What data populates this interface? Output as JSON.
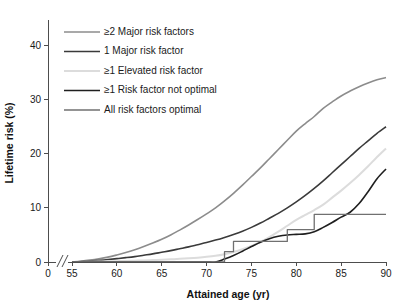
{
  "chart_data": {
    "type": "line",
    "title": "",
    "xlabel": "Attained age (yr)",
    "ylabel": "Lifetime risk (%)",
    "xlim": [
      55,
      90
    ],
    "ylim": [
      0,
      44
    ],
    "grid": false,
    "axis_break": true,
    "axis_break_label": "0",
    "legend_position": "top-left",
    "xticks": [
      "0",
      "55",
      "60",
      "65",
      "70",
      "75",
      "80",
      "85",
      "90"
    ],
    "xtick_values": [
      0,
      55,
      60,
      65,
      70,
      75,
      80,
      85,
      90
    ],
    "yticks": [
      "0",
      "10",
      "20",
      "30",
      "40"
    ],
    "ytick_values": [
      0,
      10,
      20,
      30,
      40
    ],
    "x": [
      55,
      56,
      57,
      58,
      59,
      60,
      61,
      62,
      63,
      64,
      65,
      66,
      67,
      68,
      69,
      70,
      71,
      72,
      73,
      74,
      75,
      76,
      77,
      78,
      79,
      80,
      81,
      82,
      83,
      84,
      85,
      86,
      87,
      88,
      89,
      90
    ],
    "series": [
      {
        "name": "≥2 Major risk factors",
        "color": "#8c8c8c",
        "width": 1.6,
        "values": [
          0.0,
          0.15,
          0.35,
          0.6,
          0.9,
          1.3,
          1.75,
          2.25,
          2.85,
          3.5,
          4.2,
          5.0,
          5.9,
          6.85,
          7.85,
          8.9,
          10.0,
          11.3,
          12.7,
          14.2,
          15.8,
          17.4,
          19.1,
          20.8,
          22.5,
          24.2,
          25.6,
          26.9,
          28.4,
          29.6,
          30.7,
          31.6,
          32.4,
          33.1,
          33.7,
          34.1
        ]
      },
      {
        "name": "1 Major risk factor",
        "color": "#3a3a3a",
        "width": 1.6,
        "values": [
          0.0,
          0.08,
          0.18,
          0.3,
          0.45,
          0.62,
          0.8,
          1.0,
          1.25,
          1.5,
          1.8,
          2.1,
          2.45,
          2.8,
          3.2,
          3.6,
          4.05,
          4.55,
          5.1,
          5.7,
          6.4,
          7.2,
          8.1,
          9.0,
          10.0,
          11.1,
          12.3,
          13.6,
          15.0,
          16.5,
          18.0,
          19.5,
          21.0,
          22.4,
          23.8,
          25.0
        ]
      },
      {
        "name": "≥1 Elevated risk factor",
        "color": "#dcdcdc",
        "width": 2.0,
        "values": [
          0.0,
          0.02,
          0.05,
          0.08,
          0.12,
          0.16,
          0.2,
          0.25,
          0.3,
          0.36,
          0.42,
          0.5,
          0.58,
          0.68,
          0.8,
          0.95,
          1.15,
          1.45,
          1.85,
          2.35,
          2.95,
          3.7,
          4.6,
          5.6,
          6.7,
          7.8,
          8.7,
          9.6,
          10.6,
          11.9,
          13.2,
          14.6,
          16.1,
          17.7,
          19.4,
          21.0
        ]
      },
      {
        "name": "≥1 Risk factor not optimal",
        "color": "#1f1f1f",
        "width": 1.6,
        "values": [
          0.0,
          0.0,
          0.0,
          0.0,
          0.0,
          0.0,
          0.0,
          0.0,
          0.0,
          0.0,
          0.0,
          0.0,
          0.0,
          0.0,
          0.0,
          0.0,
          0.0,
          0.55,
          1.2,
          2.0,
          2.85,
          3.65,
          4.3,
          4.75,
          5.0,
          5.1,
          5.2,
          5.6,
          6.4,
          7.3,
          8.3,
          9.2,
          10.8,
          13.0,
          15.4,
          17.2
        ]
      },
      {
        "name": "All risk factors optimal",
        "color": "#707070",
        "width": 1.3,
        "step": true,
        "values": [
          0.0,
          0.0,
          0.0,
          0.0,
          0.0,
          0.0,
          0.0,
          0.0,
          0.0,
          0.0,
          0.0,
          0.0,
          0.0,
          0.0,
          0.0,
          0.0,
          0.0,
          1.9,
          3.8,
          3.8,
          3.8,
          3.8,
          3.8,
          3.8,
          6.0,
          6.0,
          6.0,
          8.8,
          8.8,
          8.8,
          8.8,
          8.8,
          8.8,
          8.8,
          8.8,
          8.8
        ]
      }
    ]
  },
  "legend": {
    "items": [
      {
        "label": "≥2 Major risk factors",
        "color": "#8c8c8c"
      },
      {
        "label": "1 Major risk factor",
        "color": "#3a3a3a"
      },
      {
        "label": "≥1 Elevated risk factor",
        "color": "#dcdcdc"
      },
      {
        "label": "≥1 Risk factor not optimal",
        "color": "#1f1f1f"
      },
      {
        "label": "All risk factors optimal",
        "color": "#707070"
      }
    ]
  }
}
